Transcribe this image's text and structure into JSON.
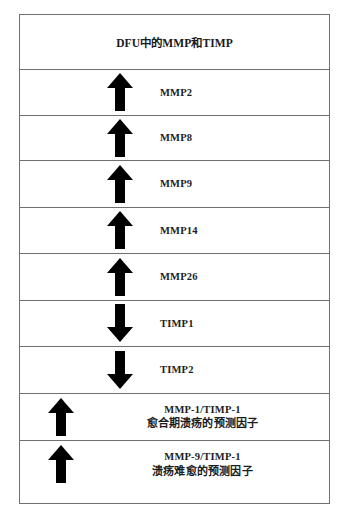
{
  "diagram": {
    "title": "DFU中的MMP和TIMP",
    "border_color": "#6f7275",
    "arrow_color": "#000000",
    "background": "#ffffff",
    "marker_rows": [
      {
        "label": "MMP2",
        "direction": "up",
        "icon": "arrow-up-icon"
      },
      {
        "label": "MMP8",
        "direction": "up",
        "icon": "arrow-up-icon"
      },
      {
        "label": "MMP9",
        "direction": "up",
        "icon": "arrow-up-icon"
      },
      {
        "label": "MMP14",
        "direction": "up",
        "icon": "arrow-up-icon"
      },
      {
        "label": "MMP26",
        "direction": "up",
        "icon": "arrow-up-icon"
      },
      {
        "label": "TIMP1",
        "direction": "down",
        "icon": "arrow-down-icon"
      },
      {
        "label": "TIMP2",
        "direction": "down",
        "icon": "arrow-down-icon"
      }
    ],
    "ratio_rows": [
      {
        "ratio": "MMP-1/TIMP-1",
        "description": "愈合期溃疡的预测因子",
        "direction": "up",
        "icon": "arrow-up-icon"
      },
      {
        "ratio": "MMP-9/TIMP-1",
        "description": "溃疡难愈的预测因子",
        "direction": "up",
        "icon": "arrow-up-icon"
      }
    ]
  }
}
